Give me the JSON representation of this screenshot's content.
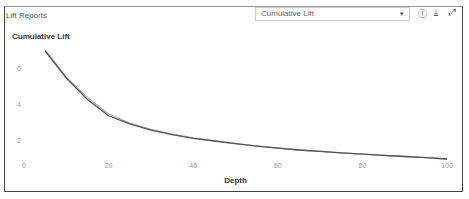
{
  "panel": {
    "title": "Lift Reports"
  },
  "selector": {
    "value": "Cumulative Lift"
  },
  "icons": [
    "info-icon",
    "download-icon",
    "expand-icon"
  ],
  "chart_data": {
    "type": "line",
    "title": "Cumulative Lift",
    "xlabel": "Depth",
    "ylabel": "",
    "xlim": [
      0,
      100
    ],
    "ylim": [
      0,
      7.5
    ],
    "xticks": [
      0,
      20,
      40,
      60,
      80,
      100
    ],
    "yticks": [
      2,
      4,
      6
    ],
    "grid": false,
    "series": [
      {
        "name": "series-1",
        "color": "#555555",
        "x": [
          5,
          10,
          15,
          20,
          25,
          30,
          35,
          40,
          45,
          50,
          55,
          60,
          65,
          70,
          75,
          80,
          85,
          90,
          95,
          100
        ],
        "y": [
          7.0,
          5.5,
          4.3,
          3.4,
          2.95,
          2.6,
          2.35,
          2.15,
          2.0,
          1.85,
          1.72,
          1.6,
          1.5,
          1.42,
          1.34,
          1.27,
          1.2,
          1.14,
          1.08,
          1.0
        ]
      },
      {
        "name": "series-2",
        "color": "#aaaaaa",
        "x": [
          5,
          10,
          15,
          20,
          25,
          30,
          35,
          40,
          45,
          50,
          55,
          60,
          65,
          70,
          75,
          80,
          85,
          90,
          95,
          100
        ],
        "y": [
          7.05,
          5.55,
          4.4,
          3.5,
          3.0,
          2.65,
          2.38,
          2.17,
          2.01,
          1.86,
          1.73,
          1.61,
          1.5,
          1.42,
          1.34,
          1.27,
          1.2,
          1.14,
          1.08,
          1.0
        ]
      }
    ]
  }
}
